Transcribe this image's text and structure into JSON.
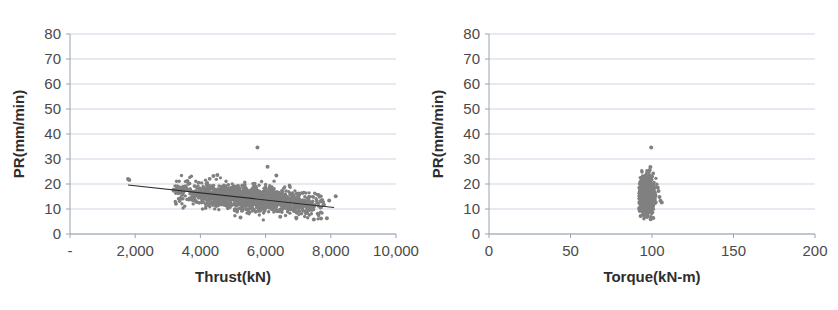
{
  "figure": {
    "background_color": "#ffffff",
    "point_color": "#808080",
    "trend_color": "#2b2b2b",
    "gridline_color": "#b9c4d6",
    "axis_color": "#9aa3b0",
    "caption_fragment": ""
  },
  "chart_data": [
    {
      "id": "thrust",
      "type": "scatter",
      "title": "",
      "xlabel": "Thrust(kN)",
      "ylabel": "PR(mm/min)",
      "xlim": [
        0,
        10000
      ],
      "ylim": [
        0,
        80
      ],
      "xticks": [
        0,
        2000,
        4000,
        6000,
        8000,
        10000
      ],
      "xtick_labels": [
        "-",
        "2,000",
        "4,000",
        "6,000",
        "8,000",
        "10,000"
      ],
      "yticks": [
        0,
        10,
        20,
        30,
        40,
        50,
        60,
        70,
        80
      ],
      "ytick_labels": [
        "0",
        "10",
        "20",
        "30",
        "40",
        "50",
        "60",
        "70",
        "80"
      ],
      "grid": true,
      "grid_axis": "y",
      "legend": "none",
      "marker_size": 1.7,
      "n_points": 1500,
      "cluster": {
        "x_center": 5500,
        "x_spread": 1150,
        "x_min": 3150,
        "x_max": 7800,
        "y_intercept": 21.5,
        "y_slope": -0.0013,
        "y_spread": 2.5,
        "y_min": 5.5,
        "y_max": 26.5
      },
      "outliers": [
        {
          "x": 1780,
          "y": 22.0
        },
        {
          "x": 1820,
          "y": 21.6
        },
        {
          "x": 5750,
          "y": 34.6
        },
        {
          "x": 6060,
          "y": 26.9
        },
        {
          "x": 6330,
          "y": 23.4
        },
        {
          "x": 5230,
          "y": 6.6
        },
        {
          "x": 6450,
          "y": 6.9
        },
        {
          "x": 7480,
          "y": 5.8
        },
        {
          "x": 7700,
          "y": 6.2
        },
        {
          "x": 7880,
          "y": 6.3
        },
        {
          "x": 8150,
          "y": 15.1
        },
        {
          "x": 7950,
          "y": 13.4
        },
        {
          "x": 7620,
          "y": 15.6
        },
        {
          "x": 4400,
          "y": 23.2
        },
        {
          "x": 4520,
          "y": 23.6
        },
        {
          "x": 3380,
          "y": 17.4
        },
        {
          "x": 3250,
          "y": 12.1
        }
      ],
      "trend": {
        "x_start": 1780,
        "y_start": 19.6,
        "x_end": 8100,
        "y_end": 10.6,
        "label": "linear trend"
      }
    },
    {
      "id": "torque",
      "type": "scatter",
      "title": "",
      "xlabel": "Torque(kN-m)",
      "ylabel": "PR(mm/min)",
      "xlim": [
        0,
        200
      ],
      "ylim": [
        0,
        80
      ],
      "xticks": [
        0,
        50,
        100,
        150,
        200
      ],
      "xtick_labels": [
        "0",
        "50",
        "100",
        "150",
        "200"
      ],
      "yticks": [
        0,
        10,
        20,
        30,
        40,
        50,
        60,
        70,
        80
      ],
      "ytick_labels": [
        "0",
        "10",
        "20",
        "30",
        "40",
        "50",
        "60",
        "70",
        "80"
      ],
      "grid": true,
      "grid_axis": "y",
      "legend": "none",
      "marker_size": 1.7,
      "n_points": 1500,
      "cluster": {
        "x_center": 96.5,
        "x_spread": 2.1,
        "x_min": 92.0,
        "x_max": 103.0,
        "y_intercept": 15.6,
        "y_slope": 0.0,
        "y_spread": 3.3,
        "y_min": 6.0,
        "y_max": 25.5
      },
      "outliers": [
        {
          "x": 99.5,
          "y": 34.6
        },
        {
          "x": 99.0,
          "y": 26.8
        },
        {
          "x": 98.6,
          "y": 25.6
        },
        {
          "x": 103.5,
          "y": 18.6
        },
        {
          "x": 104.0,
          "y": 17.2
        },
        {
          "x": 104.6,
          "y": 14.8
        },
        {
          "x": 105.2,
          "y": 13.3
        },
        {
          "x": 106.0,
          "y": 12.6
        },
        {
          "x": 100.8,
          "y": 6.4
        },
        {
          "x": 99.2,
          "y": 5.9
        },
        {
          "x": 93.0,
          "y": 7.2
        }
      ],
      "trend": null
    }
  ]
}
